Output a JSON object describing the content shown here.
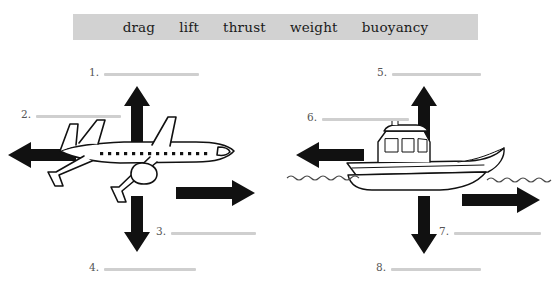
{
  "page": {
    "type": "science-worksheet",
    "topic": "forces on an airplane and a boat",
    "background_color": "#ffffff"
  },
  "word_bank": {
    "background_color": "#d2d2d2",
    "words": [
      {
        "label": "drag"
      },
      {
        "label": "lift"
      },
      {
        "label": "thrust"
      },
      {
        "label": "weight"
      },
      {
        "label": "buoyancy"
      }
    ]
  },
  "diagrams": [
    {
      "subject": "airplane",
      "blanks": [
        {
          "number": "1.",
          "arrow_direction": "up",
          "value": ""
        },
        {
          "number": "2.",
          "arrow_direction": "left",
          "value": ""
        },
        {
          "number": "3.",
          "arrow_direction": "right",
          "value": ""
        },
        {
          "number": "4.",
          "arrow_direction": "down",
          "value": ""
        }
      ]
    },
    {
      "subject": "boat",
      "blanks": [
        {
          "number": "5.",
          "arrow_direction": "up",
          "value": ""
        },
        {
          "number": "6.",
          "arrow_direction": "left",
          "value": ""
        },
        {
          "number": "7.",
          "arrow_direction": "right",
          "value": ""
        },
        {
          "number": "8.",
          "arrow_direction": "down",
          "value": ""
        }
      ]
    }
  ],
  "colors": {
    "word_bank_band": "#d2d2d2",
    "blank_rule": "#cfcfcf",
    "number_text": "#555555",
    "arrow_fill": "#111111",
    "line_art": "#111111",
    "water_line": "#4a4a4a"
  }
}
